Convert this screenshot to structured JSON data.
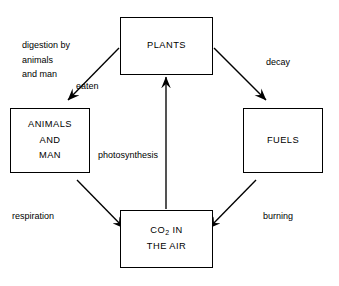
{
  "diagram": {
    "background_color": "#ffffff",
    "line_color": "#000000",
    "nodes": [
      {
        "id": "plants",
        "name": "plants-box",
        "lines": [
          "PLANTS"
        ]
      },
      {
        "id": "animals",
        "name": "animals-box",
        "lines": [
          "ANIMALS",
          "AND",
          "MAN"
        ]
      },
      {
        "id": "fuels",
        "name": "fuels-box",
        "lines": [
          "FUELS"
        ]
      },
      {
        "id": "co2",
        "name": "co2-box",
        "lines": [
          "CO2 IN",
          "THE AIR"
        ]
      }
    ],
    "node_labels": {
      "plants": "PLANTS",
      "animals_1": "ANIMALS",
      "animals_2": "AND",
      "animals_3": "MAN",
      "fuels": "FUELS",
      "co2_1_prefix": "CO",
      "co2_1_sub": "2",
      "co2_1_suffix": " IN",
      "co2_2": "THE AIR"
    },
    "edges": [
      {
        "id": "plants-to-animals",
        "from": "plants",
        "to": "animals",
        "label": "eaten",
        "note": "digestion by animals and man"
      },
      {
        "id": "plants-to-fuels",
        "from": "plants",
        "to": "fuels",
        "label": "decay"
      },
      {
        "id": "animals-to-co2",
        "from": "animals",
        "to": "co2",
        "label": "respiration"
      },
      {
        "id": "fuels-to-co2",
        "from": "fuels",
        "to": "co2",
        "label": "burning"
      },
      {
        "id": "co2-to-plants",
        "from": "co2",
        "to": "plants",
        "label": "photosynthesis"
      }
    ],
    "edge_labels": {
      "digestion_line1": "digestion by",
      "digestion_line2": "animals",
      "digestion_line3": "and man",
      "eaten": "eaten",
      "decay": "decay",
      "photosynthesis": "photosynthesis",
      "respiration": "respiration",
      "burning": "burning"
    }
  }
}
